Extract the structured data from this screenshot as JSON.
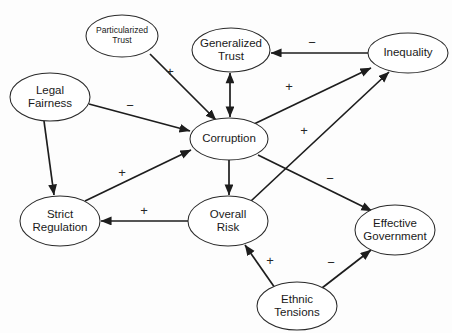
{
  "diagram": {
    "type": "directed-graph",
    "background_color": "#fdfdfd",
    "node_fill": "#ffffff",
    "node_stroke": "#2a2a2a",
    "edge_color": "#1d1d1d",
    "nodes": [
      {
        "id": "particularized-trust",
        "label_line1": "Particularized",
        "label_line2": "Trust",
        "cx": 122,
        "cy": 36,
        "rx": 36,
        "ry": 21,
        "text_size": "small"
      },
      {
        "id": "generalized-trust",
        "label_line1": "Generalized",
        "label_line2": "Trust",
        "cx": 231,
        "cy": 50,
        "rx": 39,
        "ry": 22,
        "text_size": "normal"
      },
      {
        "id": "inequality",
        "label_line1": "Inequality",
        "label_line2": "",
        "cx": 408,
        "cy": 53,
        "rx": 40,
        "ry": 20,
        "text_size": "normal"
      },
      {
        "id": "legal-fairness",
        "label_line1": "Legal",
        "label_line2": "Fairness",
        "cx": 50,
        "cy": 97,
        "rx": 40,
        "ry": 24,
        "text_size": "normal"
      },
      {
        "id": "corruption",
        "label_line1": "Corruption",
        "label_line2": "",
        "cx": 229,
        "cy": 139,
        "rx": 39,
        "ry": 21,
        "text_size": "normal"
      },
      {
        "id": "strict-regulation",
        "label_line1": "Strict",
        "label_line2": "Regulation",
        "cx": 60,
        "cy": 221,
        "rx": 40,
        "ry": 25,
        "text_size": "normal"
      },
      {
        "id": "overall-risk",
        "label_line1": "Overall",
        "label_line2": "Risk",
        "cx": 228,
        "cy": 221,
        "rx": 40,
        "ry": 25,
        "text_size": "normal"
      },
      {
        "id": "effective-government",
        "label_line1": "Effective",
        "label_line2": "Government",
        "cx": 395,
        "cy": 230,
        "rx": 40,
        "ry": 25,
        "text_size": "normal"
      },
      {
        "id": "ethnic-tensions",
        "label_line1": "Ethnic",
        "label_line2": "Tensions",
        "cx": 297,
        "cy": 306,
        "rx": 40,
        "ry": 24,
        "text_size": "normal"
      }
    ],
    "edges": [
      {
        "id": "particularized-trust-to-corruption",
        "from": "particularized-trust",
        "to": "corruption",
        "sign": "+",
        "sign_x": 170,
        "sign_y": 73,
        "arrowheads": "end",
        "x1": 150,
        "y1": 54,
        "x2": 216,
        "y2": 120
      },
      {
        "id": "inequality-to-generalized-trust",
        "from": "inequality",
        "to": "generalized-trust",
        "sign": "−",
        "sign_x": 312,
        "sign_y": 44,
        "arrowheads": "end",
        "x1": 368,
        "y1": 53,
        "x2": 271,
        "y2": 53
      },
      {
        "id": "generalized-trust-corruption-bidirectional",
        "from": "generalized-trust",
        "to": "corruption",
        "sign": "",
        "sign_x": 0,
        "sign_y": 0,
        "arrowheads": "both",
        "x1": 230,
        "y1": 73,
        "x2": 230,
        "y2": 117
      },
      {
        "id": "legal-fairness-to-corruption",
        "from": "legal-fairness",
        "to": "corruption",
        "sign": "−",
        "sign_x": 130,
        "sign_y": 107,
        "arrowheads": "end",
        "x1": 89,
        "y1": 104,
        "x2": 190,
        "y2": 131
      },
      {
        "id": "legal-fairness-to-strict-regulation",
        "from": "legal-fairness",
        "to": "strict-regulation",
        "sign": "",
        "sign_x": 0,
        "sign_y": 0,
        "arrowheads": "end",
        "x1": 44,
        "y1": 121,
        "x2": 54,
        "y2": 195
      },
      {
        "id": "strict-regulation-to-corruption",
        "from": "strict-regulation",
        "to": "corruption",
        "sign": "+",
        "sign_x": 122,
        "sign_y": 174,
        "arrowheads": "end",
        "x1": 85,
        "y1": 201,
        "x2": 191,
        "y2": 150
      },
      {
        "id": "corruption-to-inequality",
        "from": "corruption",
        "to": "inequality",
        "sign": "+",
        "sign_x": 289,
        "sign_y": 88,
        "arrowheads": "end",
        "x1": 254,
        "y1": 124,
        "x2": 371,
        "y2": 68
      },
      {
        "id": "corruption-to-overall-risk",
        "from": "corruption",
        "to": "overall-risk",
        "sign": "",
        "sign_x": 0,
        "sign_y": 0,
        "arrowheads": "end",
        "x1": 229,
        "y1": 160,
        "x2": 229,
        "y2": 195
      },
      {
        "id": "corruption-to-effective-government",
        "from": "corruption",
        "to": "effective-government",
        "sign": "−",
        "sign_x": 330,
        "sign_y": 180,
        "arrowheads": "end",
        "x1": 258,
        "y1": 155,
        "x2": 372,
        "y2": 211
      },
      {
        "id": "overall-risk-to-inequality",
        "from": "overall-risk",
        "to": "inequality",
        "sign": "+",
        "sign_x": 304,
        "sign_y": 132,
        "arrowheads": "end",
        "x1": 251,
        "y1": 201,
        "x2": 389,
        "y2": 72
      },
      {
        "id": "overall-risk-to-strict-regulation",
        "from": "overall-risk",
        "to": "strict-regulation",
        "sign": "+",
        "sign_x": 144,
        "sign_y": 212,
        "arrowheads": "end",
        "x1": 188,
        "y1": 221,
        "x2": 101,
        "y2": 221
      },
      {
        "id": "ethnic-tensions-to-overall-risk",
        "from": "ethnic-tensions",
        "to": "overall-risk",
        "sign": "+",
        "sign_x": 270,
        "sign_y": 262,
        "arrowheads": "end",
        "x1": 275,
        "y1": 288,
        "x2": 245,
        "y2": 245
      },
      {
        "id": "ethnic-tensions-to-effective-government",
        "from": "ethnic-tensions",
        "to": "effective-government",
        "sign": "−",
        "sign_x": 331,
        "sign_y": 264,
        "arrowheads": "end",
        "x1": 322,
        "y1": 288,
        "x2": 371,
        "y2": 250
      }
    ]
  }
}
